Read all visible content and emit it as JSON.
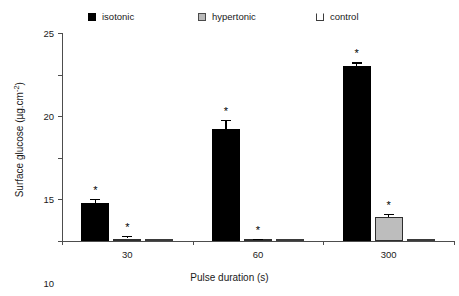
{
  "chart_data": {
    "type": "bar",
    "title": "",
    "xlabel": "Pulse duration (s)",
    "ylabel": "Surface glucose (µg.cm⁻²)",
    "categories": [
      "30",
      "60",
      "300"
    ],
    "ylim": [
      0,
      25
    ],
    "yticks": [
      0,
      5,
      10,
      15,
      20,
      25
    ],
    "ytick_labels": [
      "0",
      "5",
      "10",
      "15",
      "20",
      "25"
    ],
    "grid": false,
    "legend_position": "top",
    "series": [
      {
        "name": "isotonic",
        "color": "#000000",
        "values": [
          4.6,
          13.5,
          21.0
        ],
        "errors": [
          0.45,
          1.1,
          0.5
        ],
        "significance": [
          "*",
          "*",
          "*"
        ]
      },
      {
        "name": "hypertonic",
        "color": "#bdbdbd",
        "values": [
          0.3,
          0.15,
          2.9
        ],
        "errors": [
          0.35,
          0.15,
          0.35
        ],
        "significance": [
          "*",
          "*",
          "*"
        ]
      },
      {
        "name": "control",
        "color": "#7a7a7a",
        "values": [
          0.05,
          0.1,
          0.05
        ],
        "errors": [
          0.0,
          0.0,
          0.0
        ],
        "significance": [
          "",
          "",
          ""
        ]
      }
    ]
  },
  "legend": {
    "items": [
      {
        "label": "isotonic",
        "swatch": "filled-black-square-icon"
      },
      {
        "label": "hypertonic",
        "swatch": "filled-gray-square-icon"
      },
      {
        "label": "control",
        "swatch": "open-square-icon"
      }
    ]
  },
  "axes": {
    "y_title_main": "Surface glucose (µg.cm",
    "y_title_sup": "-2",
    "y_title_close": ")",
    "x_title": "Pulse duration (s)"
  }
}
